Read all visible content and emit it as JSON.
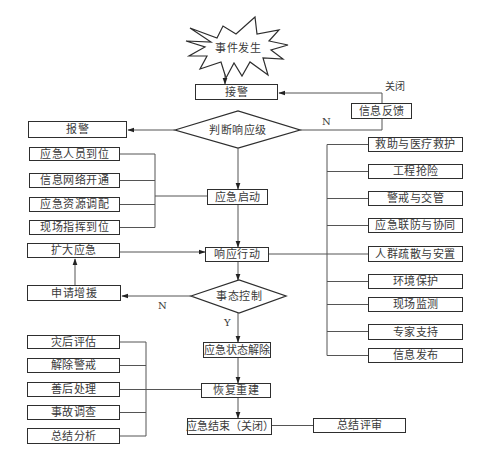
{
  "diagram": {
    "type": "flowchart",
    "start": {
      "label": "事件发生",
      "shape": "starburst"
    },
    "nodes": {
      "receive_alarm": "接警",
      "judge_level": "判断响应级",
      "report_alarm": "报警",
      "info_feedback": "信息反馈",
      "emergency_start": "应急启动",
      "response_action": "响应行动",
      "situation_control": "事态控制",
      "expand_emergency": "扩大应急",
      "request_reinforcement": "申请增援",
      "emergency_lifted": "应急状态解除",
      "recovery": "恢复重建",
      "emergency_end": "应急结束（关闭）",
      "summary_review": "总结评审"
    },
    "startup_tasks": [
      {
        "label": "应急人员到位"
      },
      {
        "label": "信息网络开通"
      },
      {
        "label": "应急资源调配"
      },
      {
        "label": "现场指挥到位"
      }
    ],
    "response_tasks": [
      {
        "label": "救助与医疗救护"
      },
      {
        "label": "工程抢险"
      },
      {
        "label": "警戒与交管"
      },
      {
        "label": "应急联防与协同"
      },
      {
        "label": "人群疏散与安置"
      },
      {
        "label": "环境保护"
      },
      {
        "label": "现场监测"
      },
      {
        "label": "专家支持"
      },
      {
        "label": "信息发布"
      }
    ],
    "recovery_tasks": [
      {
        "label": "灾后评估"
      },
      {
        "label": "解除警戒"
      },
      {
        "label": "善后处理"
      },
      {
        "label": "事故调查"
      },
      {
        "label": "总结分析"
      }
    ],
    "edge_labels": {
      "close": "关闭",
      "judge_no": "N",
      "control_no": "N",
      "control_yes": "Y"
    },
    "colors": {
      "line": "#555555",
      "border": "#2e2e2e",
      "text": "#3a3a3a",
      "background": "#ffffff"
    }
  }
}
